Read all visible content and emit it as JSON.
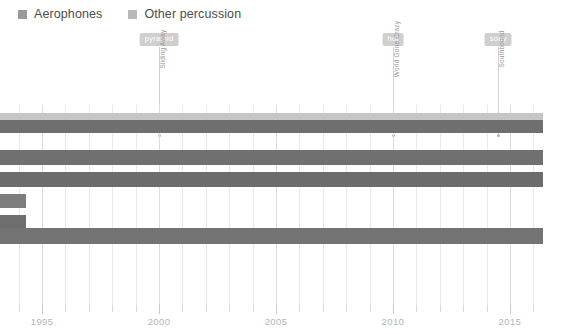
{
  "legend": {
    "position": "top-left",
    "items": [
      {
        "label": "Aerophones",
        "color": "#9a9a9a",
        "icon": "square-swatch-icon"
      },
      {
        "label": "Other percussion",
        "color": "#b8b8b8",
        "icon": "square-swatch-icon"
      }
    ]
  },
  "chart_data": {
    "type": "bar",
    "orientation": "horizontal",
    "title": "",
    "subtitle": "",
    "xlabel": "",
    "ylabel": "",
    "xlim": [
      1993.2,
      2016.8
    ],
    "grid": true,
    "legend_position": "top-left",
    "axis": {
      "major_ticks": [
        1995,
        2000,
        2005,
        2010,
        2015
      ],
      "major_tick_labels": [
        "1995",
        "2000",
        "2005",
        "2010",
        "2015"
      ],
      "minor_tick_step": 1,
      "minor_ticks": [
        1994,
        1995,
        1996,
        1997,
        1998,
        1999,
        2000,
        2001,
        2002,
        2003,
        2004,
        2005,
        2006,
        2007,
        2008,
        2009,
        2010,
        2011,
        2012,
        2013,
        2014,
        2015,
        2016
      ]
    },
    "series": [
      {
        "name": "Aerophones",
        "color": "#9a9a9a"
      },
      {
        "name": "Other percussion",
        "color": "#b8b8b8"
      }
    ],
    "bars": [
      {
        "label": "row-1",
        "series": "Other percussion",
        "start": 1993.2,
        "end": 2016.4,
        "color": "#c6c6c6",
        "top": 8,
        "height": 7
      },
      {
        "label": "row-2",
        "series": "Aerophones",
        "start": 1993.2,
        "end": 2016.4,
        "color": "#6f6f6f",
        "top": 15,
        "height": 13
      },
      {
        "label": "row-3",
        "series": "Aerophones",
        "start": 1993.2,
        "end": 2016.4,
        "color": "#707070",
        "top": 45,
        "height": 15
      },
      {
        "label": "row-4",
        "series": "Aerophones",
        "start": 1993.2,
        "end": 2016.4,
        "color": "#6c6c6c",
        "top": 67,
        "height": 15
      },
      {
        "label": "row-5",
        "series": "Aerophones",
        "start": 1993.2,
        "end": 1994.3,
        "color": "#7d7d7d",
        "top": 89,
        "height": 14
      },
      {
        "label": "row-6",
        "series": "Aerophones",
        "start": 1993.2,
        "end": 1994.3,
        "color": "#6e6e6e",
        "top": 110,
        "height": 14
      },
      {
        "label": "row-7",
        "series": "Aerophones",
        "start": 1993.2,
        "end": 2016.4,
        "color": "#737373",
        "top": 123,
        "height": 16
      }
    ],
    "annotations": [
      {
        "badge": "pyramid",
        "text": "Sliding Away",
        "year": 2000
      },
      {
        "badge": "hoi",
        "text": "World Gone Crazy",
        "year": 2010
      },
      {
        "badge": "sony",
        "text": "Southbound",
        "year": 2014.5
      }
    ]
  },
  "colors": {
    "background": "#ffffff",
    "gridline": "#e9e9e9",
    "gridline_major": "#dcdcdc",
    "tick": "#d7d7d7",
    "tick_label": "#b4b4b4",
    "badge_bg": "#cfcfcf",
    "badge_text": "#ffffff",
    "annot_text": "#9a9a9a",
    "annot_line": "#d2d2d2",
    "legend_text": "#4c4c4c"
  }
}
